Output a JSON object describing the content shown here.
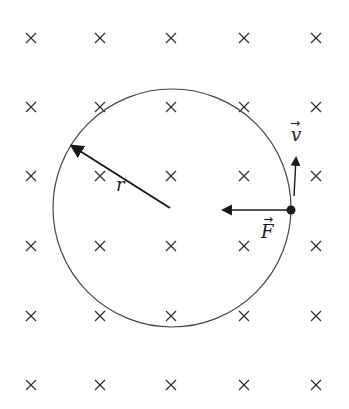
{
  "diagram": {
    "field_symbol": "×",
    "field_grid": {
      "columns_x": [
        31,
        100,
        171,
        244,
        316
      ],
      "rows_y": [
        38,
        107,
        176,
        246,
        316,
        385
      ]
    },
    "circle": {
      "cx": 172,
      "cy": 208,
      "r": 119
    },
    "labels": {
      "radius": "r",
      "force": "F",
      "velocity": "v",
      "vector_arrow": "→"
    },
    "colors": {
      "ink": "#1a1a1a",
      "background": "#ffffff"
    }
  }
}
